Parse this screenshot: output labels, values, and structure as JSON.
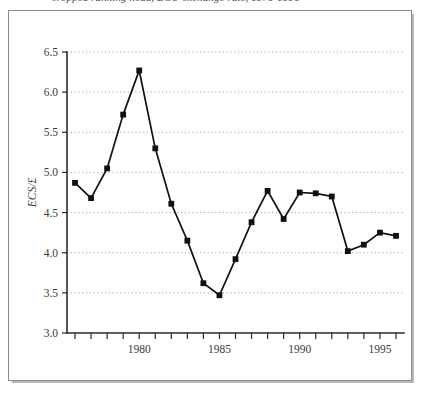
{
  "caption": {
    "text": "cropped running head, ECU exchange rate, 1976-1996"
  },
  "chart_data": {
    "type": "line",
    "title": "",
    "subtitle": "",
    "xlabel": "",
    "ylabel": "ECS/£",
    "ylim": [
      3.0,
      6.5
    ],
    "xlim": [
      1975.5,
      1996.5
    ],
    "grid": true,
    "legend": false,
    "legend_position": "none",
    "marker": "square",
    "line_color": "#111111",
    "marker_color": "#111111",
    "grid_color": "#9a9a9a",
    "axis_color": "#2b2b2b",
    "y_ticks": [
      "3.0",
      "3.5",
      "4.0",
      "4.5",
      "5.0",
      "5.5",
      "6.0",
      "6.5"
    ],
    "y_tick_values": [
      3.0,
      3.5,
      4.0,
      4.5,
      5.0,
      5.5,
      6.0,
      6.5
    ],
    "x_ticks_labeled": [
      "1980",
      "1985",
      "1990",
      "1995"
    ],
    "x_tick_values_labeled": [
      1980,
      1985,
      1990,
      1995
    ],
    "x_tick_values_all": [
      1976,
      1977,
      1978,
      1979,
      1980,
      1981,
      1982,
      1983,
      1984,
      1985,
      1986,
      1987,
      1988,
      1989,
      1990,
      1991,
      1992,
      1993,
      1994,
      1995,
      1996
    ],
    "x": [
      1976,
      1977,
      1978,
      1979,
      1980,
      1981,
      1982,
      1983,
      1984,
      1985,
      1986,
      1987,
      1988,
      1989,
      1990,
      1991,
      1992,
      1993,
      1994,
      1995,
      1996
    ],
    "values": [
      4.87,
      4.68,
      5.05,
      5.72,
      6.27,
      5.3,
      4.61,
      4.15,
      3.62,
      3.47,
      3.92,
      4.38,
      4.77,
      4.42,
      4.75,
      4.74,
      4.7,
      4.02,
      4.1,
      4.25,
      4.21
    ],
    "series": [
      {
        "name": "ECS/£",
        "values": [
          4.87,
          4.68,
          5.05,
          5.72,
          6.27,
          5.3,
          4.61,
          4.15,
          3.62,
          3.47,
          3.92,
          4.38,
          4.77,
          4.42,
          4.75,
          4.74,
          4.7,
          4.02,
          4.1,
          4.25,
          4.21
        ]
      }
    ]
  }
}
